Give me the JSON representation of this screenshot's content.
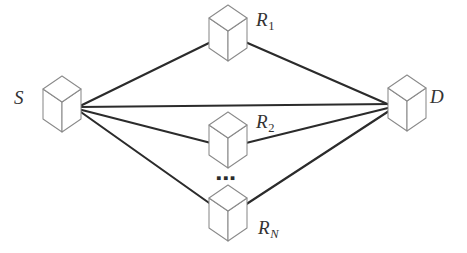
{
  "diagram": {
    "background_color": "#ffffff",
    "edge_color": "#2b2b2b",
    "cube_stroke_color": "#8a8a8a",
    "cube_fill_color": "#ffffff",
    "label_color": "#333333",
    "width": 467,
    "height": 253
  },
  "nodes": {
    "source": {
      "id": "S",
      "label": "S",
      "subscript": "",
      "role": "source",
      "cube_center_x": 62,
      "cube_center_y": 104,
      "label_x": 14,
      "label_y": 88,
      "connection_x": 78,
      "connection_y": 107
    },
    "destination": {
      "id": "D",
      "label": "D",
      "subscript": "",
      "role": "destination",
      "cube_center_x": 407,
      "cube_center_y": 103,
      "label_x": 430,
      "label_y": 87,
      "connection_x": 392,
      "connection_y": 106
    },
    "relays": [
      {
        "id": "R1",
        "label": "R",
        "subscript": "1",
        "subscript_style": "upright",
        "role": "relay",
        "cube_center_x": 228,
        "cube_center_y": 33,
        "label_x": 256,
        "label_y": 10,
        "left_attach_x": 213,
        "left_attach_y": 41,
        "right_attach_x": 243,
        "right_attach_y": 41
      },
      {
        "id": "R2",
        "label": "R",
        "subscript": "2",
        "subscript_style": "upright",
        "role": "relay",
        "cube_center_x": 228,
        "cube_center_y": 140,
        "label_x": 256,
        "label_y": 112,
        "left_attach_x": 211,
        "left_attach_y": 143,
        "right_attach_x": 246,
        "right_attach_y": 143
      },
      {
        "id": "RN",
        "label": "R",
        "subscript": "N",
        "subscript_style": "italic",
        "role": "relay",
        "cube_center_x": 228,
        "cube_center_y": 213,
        "label_x": 258,
        "label_y": 218,
        "left_attach_x": 212,
        "left_attach_y": 205,
        "right_attach_x": 245,
        "right_attach_y": 205
      }
    ]
  },
  "ellipsis": {
    "text": "▪▪▪",
    "meaning": "additional relay nodes omitted",
    "x": 216,
    "y": 170
  },
  "edges": [
    {
      "id": "s-r1",
      "from": "S",
      "to": "R1",
      "x1": 78,
      "y1": 107,
      "x2": 213,
      "y2": 41
    },
    {
      "id": "r1-d",
      "from": "R1",
      "to": "D",
      "x1": 243,
      "y1": 41,
      "x2": 392,
      "y2": 106
    },
    {
      "id": "s-d",
      "from": "S",
      "to": "D",
      "x1": 78,
      "y1": 107,
      "x2": 392,
      "y2": 104
    },
    {
      "id": "s-r2",
      "from": "S",
      "to": "R2",
      "x1": 78,
      "y1": 109,
      "x2": 211,
      "y2": 143
    },
    {
      "id": "r2-d",
      "from": "R2",
      "to": "D",
      "x1": 246,
      "y1": 143,
      "x2": 392,
      "y2": 107
    },
    {
      "id": "s-rn",
      "from": "S",
      "to": "RN",
      "x1": 78,
      "y1": 110,
      "x2": 212,
      "y2": 205
    },
    {
      "id": "rn-d",
      "from": "RN",
      "to": "D",
      "x1": 245,
      "y1": 205,
      "x2": 392,
      "y2": 109
    }
  ],
  "cube_geometry": {
    "half_width": 19,
    "top_height": 13,
    "body_height": 30,
    "description": "isometric wireframe cube: rhombus top face plus left and right vertical side faces"
  }
}
